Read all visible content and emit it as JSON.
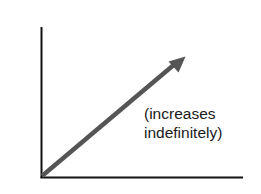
{
  "diagram": {
    "type": "growth-graph",
    "annotation": {
      "line1": "(increases",
      "line2": "indefinitely)"
    },
    "colors": {
      "axis": "#111111",
      "arrow": "#555555",
      "text": "#1a1a1a",
      "background": "#ffffff"
    }
  }
}
